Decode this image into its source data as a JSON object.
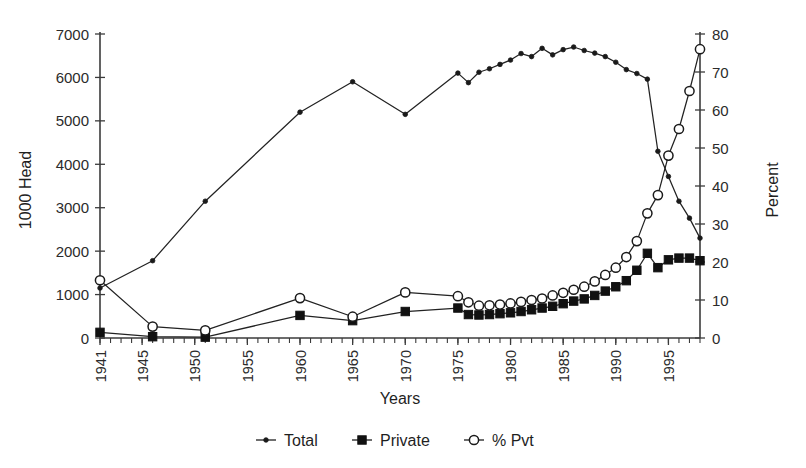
{
  "chart_data": {
    "type": "line",
    "title": "",
    "xlabel": "Years",
    "ylabel": "1000 Head",
    "y2label": "Percent",
    "grid": false,
    "legend_position": "bottom",
    "xlim": [
      1941,
      1998
    ],
    "ylim": [
      0,
      7000
    ],
    "y2lim": [
      0,
      80
    ],
    "ytick_labels": [
      "0",
      "1000",
      "2000",
      "3000",
      "4000",
      "5000",
      "6000",
      "7000"
    ],
    "ytick_values": [
      0,
      1000,
      2000,
      3000,
      4000,
      5000,
      6000,
      7000
    ],
    "y2tick_labels": [
      "0",
      "10",
      "20",
      "30",
      "40",
      "50",
      "60",
      "70",
      "80"
    ],
    "y2tick_values": [
      0,
      10,
      20,
      30,
      40,
      50,
      60,
      70,
      80
    ],
    "xtick_labels": [
      "1941",
      "1945",
      "1950",
      "1955",
      "1960",
      "1965",
      "1970",
      "1975",
      "1980",
      "1985",
      "1990",
      "1995"
    ],
    "xtick_values": [
      1941,
      1945,
      1950,
      1955,
      1960,
      1965,
      1970,
      1975,
      1980,
      1985,
      1990,
      1995
    ],
    "x_minor_step": 1,
    "series": [
      {
        "name": "Total",
        "axis": "left",
        "marker": "small-filled-circle",
        "x": [
          1941,
          1946,
          1951,
          1960,
          1965,
          1970,
          1975,
          1976,
          1977,
          1978,
          1979,
          1980,
          1981,
          1982,
          1983,
          1984,
          1985,
          1986,
          1987,
          1988,
          1989,
          1990,
          1991,
          1992,
          1993,
          1994,
          1995,
          1996,
          1997,
          1998
        ],
        "values": [
          1150,
          1780,
          3150,
          5200,
          5900,
          5150,
          6100,
          5880,
          6120,
          6200,
          6300,
          6400,
          6550,
          6480,
          6670,
          6520,
          6640,
          6700,
          6620,
          6560,
          6480,
          6350,
          6180,
          6090,
          5960,
          4300,
          3720,
          3150,
          2760,
          2300
        ]
      },
      {
        "name": "Private",
        "axis": "left",
        "marker": "filled-square",
        "x": [
          1941,
          1946,
          1951,
          1960,
          1965,
          1970,
          1975,
          1976,
          1977,
          1978,
          1979,
          1980,
          1981,
          1982,
          1983,
          1984,
          1985,
          1986,
          1987,
          1988,
          1989,
          1990,
          1991,
          1992,
          1993,
          1994,
          1995,
          1996,
          1997,
          1998
        ],
        "values": [
          130,
          30,
          20,
          520,
          400,
          610,
          690,
          540,
          530,
          540,
          560,
          580,
          610,
          650,
          690,
          730,
          790,
          850,
          900,
          980,
          1080,
          1180,
          1320,
          1560,
          1950,
          1620,
          1800,
          1840,
          1840,
          1780
        ]
      },
      {
        "name": "% Pvt",
        "axis": "right",
        "marker": "open-circle",
        "x": [
          1941,
          1946,
          1951,
          1960,
          1965,
          1970,
          1975,
          1976,
          1977,
          1978,
          1979,
          1980,
          1981,
          1982,
          1983,
          1984,
          1985,
          1986,
          1987,
          1988,
          1989,
          1990,
          1991,
          1992,
          1993,
          1994,
          1995,
          1996,
          1997,
          1998
        ],
        "values": [
          15.2,
          3.0,
          2.0,
          10.5,
          5.6,
          12.0,
          11.0,
          9.4,
          8.5,
          8.6,
          8.8,
          9.1,
          9.5,
          10.0,
          10.4,
          11.2,
          11.9,
          12.7,
          13.5,
          14.9,
          16.6,
          18.5,
          21.3,
          25.5,
          32.8,
          37.6,
          48.0,
          55.0,
          65.0,
          76.0
        ]
      }
    ]
  },
  "legend": {
    "items": [
      {
        "label": "Total",
        "marker": "small-filled-circle"
      },
      {
        "label": "Private",
        "marker": "filled-square"
      },
      {
        "label": "% Pvt",
        "marker": "open-circle"
      }
    ]
  },
  "colors": {
    "ink": "#1a1a1a",
    "axis": "#3b3b3b",
    "background": "#ffffff",
    "marker_fill": "#111111",
    "open_marker_fill": "#ffffff"
  }
}
